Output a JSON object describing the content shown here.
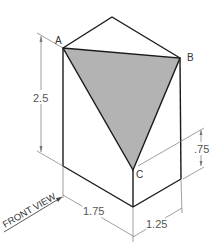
{
  "diagram": {
    "type": "isometric-block-with-shaded-triangle",
    "points": {
      "A": "A",
      "B": "B",
      "C": "C"
    },
    "dimensions": {
      "height": "2.5",
      "front_width": "1.75",
      "side_width": "1.25",
      "c_height": ".75"
    },
    "view_label": "FRONT VIEW",
    "colors": {
      "outline": "#1a1a1a",
      "shade": "#b3b3b3",
      "dim_line": "#777777"
    }
  }
}
